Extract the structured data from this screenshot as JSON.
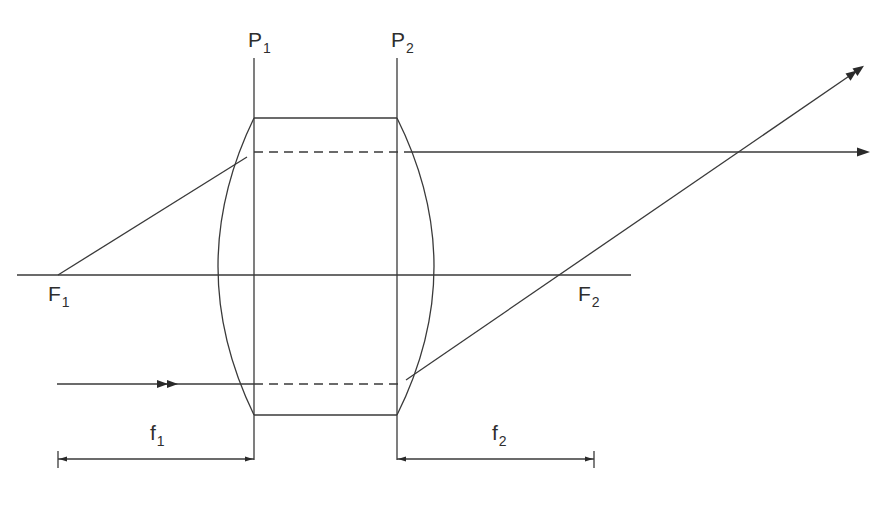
{
  "diagram": {
    "stroke_color": "#3a3a3a",
    "background": "#ffffff",
    "labels": {
      "P1": {
        "main": "P",
        "sub": "1"
      },
      "P2": {
        "main": "P",
        "sub": "2"
      },
      "F1": {
        "main": "F",
        "sub": "1"
      },
      "F2": {
        "main": "F",
        "sub": "2"
      },
      "f1": {
        "main": "f",
        "sub": "1"
      },
      "f2": {
        "main": "f",
        "sub": "2"
      }
    },
    "geometry": {
      "optical_axis": {
        "x1": 17,
        "x2": 631,
        "y": 275
      },
      "principal_plane_1": {
        "x": 254,
        "y1": 58,
        "y2": 460
      },
      "principal_plane_2": {
        "x": 397,
        "y1": 58,
        "y2": 460
      },
      "lens": {
        "top_y": 118,
        "bottom_y": 415,
        "left_x": 254,
        "right_x": 397,
        "left_bulge_x": 218,
        "right_bulge_x": 434
      },
      "F1_point": {
        "x": 58,
        "y": 275
      },
      "F2_point": {
        "x": 573,
        "y": 275
      },
      "ray_top": {
        "from": [
          58,
          275
        ],
        "to": [
          247,
          157
        ],
        "dashed_y": 152,
        "dashed_x1": 254,
        "dashed_x2": 405,
        "exit_x2": 868
      },
      "ray_bottom": {
        "from_x": 57,
        "y": 384,
        "dashed_x1": 254,
        "dashed_x2": 398,
        "exit_from": [
          406,
          380
        ],
        "exit_to": [
          862,
          67
        ]
      },
      "dimension_f1": {
        "x1": 58,
        "x2": 254,
        "y": 459
      },
      "dimension_f2": {
        "x1": 397,
        "x2": 594,
        "y": 459
      }
    }
  }
}
